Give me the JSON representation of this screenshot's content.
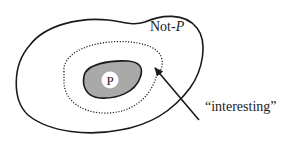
{
  "diagram": {
    "regions": {
      "outer": {
        "label_prefix": "Not-",
        "label_var": "P"
      },
      "inner": {
        "label": "P",
        "fill": "#a9a9a9"
      },
      "boundary": {
        "style": "dotted"
      }
    },
    "annotation": {
      "text": "“interesting”",
      "points_to": "dotted boundary"
    },
    "colors": {
      "stroke": "#1a1a1a",
      "inner_fill": "#a9a9a9",
      "label_bg": "#ffffff"
    }
  }
}
